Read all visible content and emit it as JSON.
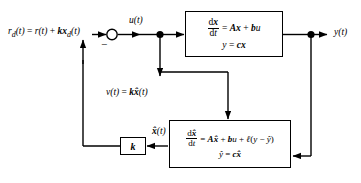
{
  "diagram": {
    "background": "#ffffff",
    "line_color": "#000000",
    "width": 361,
    "height": 183
  },
  "signals": {
    "reference_label": "r_d(t) = r(t) + kx_d(t)",
    "reference_parts": {
      "r_main": "r",
      "r_main_sub": "d",
      "t1": "(t)",
      "eq": " = ",
      "r2": "r",
      "t2": "(t)",
      "plus": " + ",
      "k": "k",
      "x": "x",
      "x_sub": "d",
      "t3": "(t)"
    },
    "control_label": "u(t)",
    "output_label": "y(t)",
    "feedback_label": "v(t) = kx̂(t)",
    "feedback_parts": {
      "v": "v",
      "t1": "(t)",
      "eq": " = ",
      "k": "k",
      "xhat": "x̂",
      "t2": "(t)"
    },
    "state_estimate_label": "x̂(t)",
    "state_estimate_parts": {
      "xhat": "x̂",
      "t": "(t)"
    },
    "summing_sign": "−"
  },
  "blocks": {
    "plant": {
      "name": "plant",
      "equation1": {
        "numerator": "dx",
        "denominator": "dt",
        "rhs": "= Ax + bu",
        "rhs_parts": {
          "eq": "= ",
          "A": "A",
          "x": "x",
          "plus": " + ",
          "b": "b",
          "u": "u"
        }
      },
      "equation2": {
        "text": "y = cx",
        "parts": {
          "y": "y",
          "eq": " = ",
          "c": "c",
          "x": "x"
        }
      }
    },
    "observer": {
      "name": "observer",
      "equation1": {
        "numerator": "dx̂",
        "denominator": "dt",
        "rhs": "= Ax̂ + bu + ℓ(y − ŷ)",
        "rhs_parts": {
          "eq": "= ",
          "A": "A",
          "xhat": "x̂",
          "plus1": " + ",
          "b": "b",
          "u": "u",
          "plus2": " + ",
          "l": "ℓ",
          "paren_open": "(",
          "y": "y",
          "minus": " − ",
          "yhat": "ŷ",
          "paren_close": ")"
        }
      },
      "equation2": {
        "text": "ŷ = cx̂",
        "parts": {
          "yhat": "ŷ",
          "eq": " = ",
          "c": "c",
          "xhat": "x̂"
        }
      }
    },
    "gain": {
      "name": "gain",
      "label": "k"
    }
  }
}
